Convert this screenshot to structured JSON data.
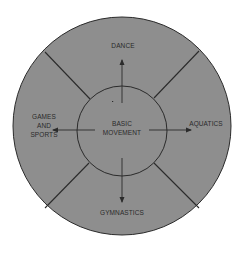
{
  "diagram": {
    "center": {
      "line1": "BASIC",
      "line2": "MOVEMENT"
    },
    "branches": {
      "top": "DANCE",
      "left": {
        "line1": "GAMES",
        "line2": "AND",
        "line3": "SPORTS"
      },
      "right": "AQUATICS",
      "bottom": "GYMNASTICS"
    },
    "colors": {
      "fill": "#8e8e8e",
      "stroke": "#2b2b2b",
      "background": "#ffffff",
      "text": "#2a2a2a"
    }
  }
}
